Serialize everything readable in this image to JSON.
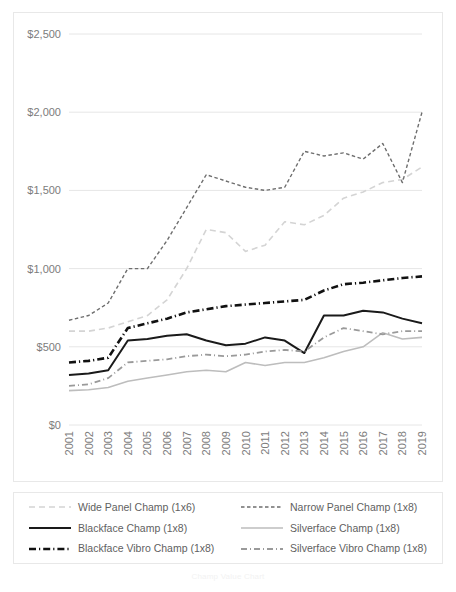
{
  "chart_data": {
    "type": "line",
    "title": "",
    "subtitle": "",
    "xlabel": "",
    "ylabel": "",
    "xlim": [
      2001,
      2019
    ],
    "ylim": [
      0,
      2500
    ],
    "ytick_step": 500,
    "grid": "horizontal",
    "legend_position": "bottom",
    "y_tick_labels": [
      "$0",
      "$500",
      "$1,000",
      "$1,500",
      "$2,000",
      "$2,500"
    ],
    "y_tick_values": [
      0,
      500,
      1000,
      1500,
      2000,
      2500
    ],
    "categories": [
      2001,
      2002,
      2003,
      2004,
      2005,
      2006,
      2007,
      2008,
      2009,
      2010,
      2011,
      2012,
      2013,
      2014,
      2015,
      2016,
      2017,
      2018,
      2019
    ],
    "x_tick_labels": [
      "2001",
      "2002",
      "2003",
      "2004",
      "2005",
      "2006",
      "2007",
      "2008",
      "2009",
      "2010",
      "2011",
      "2012",
      "2013",
      "2014",
      "2015",
      "2016",
      "2017",
      "2018",
      "2019"
    ],
    "series": [
      {
        "name": "Wide Panel Champ (1x6)",
        "style": "long-dash",
        "color": "#d4d4d4",
        "width": 1.6,
        "values": [
          600,
          600,
          620,
          660,
          700,
          800,
          1000,
          1250,
          1230,
          1110,
          1150,
          1300,
          1280,
          1340,
          1450,
          1490,
          1550,
          1570,
          1650
        ]
      },
      {
        "name": "Narrow Panel Champ (1x8)",
        "style": "short-dash",
        "color": "#6e6e6e",
        "width": 1.4,
        "values": [
          670,
          700,
          780,
          1000,
          1000,
          1180,
          1390,
          1600,
          1560,
          1520,
          1500,
          1520,
          1750,
          1720,
          1740,
          1700,
          1800,
          1550,
          2000
        ]
      },
      {
        "name": "Blackface Champ (1x8)",
        "style": "solid",
        "color": "#1a1a1a",
        "width": 2.0,
        "values": [
          320,
          330,
          350,
          540,
          550,
          570,
          580,
          540,
          510,
          520,
          560,
          540,
          460,
          700,
          700,
          730,
          720,
          680,
          650
        ]
      },
      {
        "name": "Silverface Champ (1x8)",
        "style": "solid",
        "color": "#bdbdbd",
        "width": 1.6,
        "values": [
          220,
          225,
          240,
          280,
          300,
          320,
          340,
          350,
          340,
          400,
          380,
          400,
          400,
          430,
          470,
          500,
          590,
          550,
          560
        ]
      },
      {
        "name": "Blackface Vibro Champ (1x8)",
        "style": "dash-dot",
        "color": "#111111",
        "width": 2.6,
        "values": [
          400,
          410,
          430,
          620,
          650,
          680,
          720,
          740,
          760,
          770,
          780,
          790,
          800,
          860,
          900,
          910,
          925,
          940,
          950
        ]
      },
      {
        "name": "Silverface Vibro Champ (1x8)",
        "style": "dash-dot",
        "color": "#9a9a9a",
        "width": 1.8,
        "values": [
          250,
          260,
          300,
          400,
          410,
          420,
          440,
          450,
          440,
          450,
          470,
          480,
          470,
          560,
          620,
          600,
          580,
          600,
          600
        ]
      }
    ]
  },
  "legend": {
    "items": [
      {
        "label": "Wide Panel Champ (1x6)",
        "series_index": 0
      },
      {
        "label": "Narrow Panel Champ (1x8)",
        "series_index": 1
      },
      {
        "label": "Blackface Champ (1x8)",
        "series_index": 2
      },
      {
        "label": "Silverface Champ (1x8)",
        "series_index": 3
      },
      {
        "label": "Blackface Vibro Champ (1x8)",
        "series_index": 4
      },
      {
        "label": "Silverface Vibro Champ (1x8)",
        "series_index": 5
      }
    ]
  },
  "caption": {
    "text": "Champ Value Chart"
  }
}
